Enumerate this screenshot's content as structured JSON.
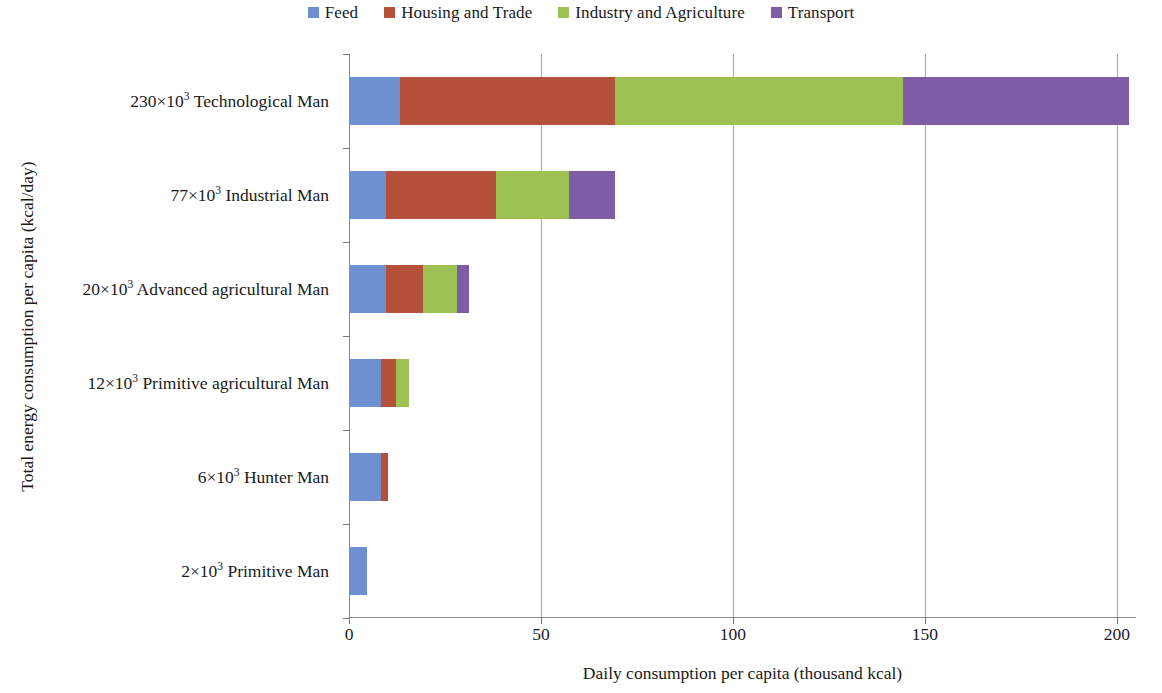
{
  "chart_data": {
    "type": "bar",
    "orientation": "horizontal",
    "stacked": true,
    "title": "",
    "xlabel": "Daily consumption per capita (thousand kcal)",
    "ylabel": "Total energy consumption per capita (kcal/day)",
    "xlim": [
      0,
      205
    ],
    "xticks": [
      0,
      50,
      100,
      150,
      200
    ],
    "xticklabels": [
      "0",
      "50",
      "100",
      "150",
      "200"
    ],
    "grid": "vertical",
    "legend_position": "top-center",
    "categories": [
      "230×10³ Technological Man",
      "77×10³ Industrial Man",
      "20×10³ Advanced agricultural Man",
      "12×10³ Primitive agricultural Man",
      "6×10³ Hunter Man",
      "2×10³ Primitive Man"
    ],
    "category_parts": [
      {
        "value": "230",
        "multiplier": "×10",
        "exponent": "3",
        "name": "Technological Man"
      },
      {
        "value": "77",
        "multiplier": "×10",
        "exponent": "3",
        "name": "Industrial Man"
      },
      {
        "value": "20",
        "multiplier": "×10",
        "exponent": "3",
        "name": "Advanced agricultural Man"
      },
      {
        "value": "12",
        "multiplier": "×10",
        "exponent": "3",
        "name": "Primitive agricultural Man"
      },
      {
        "value": "6",
        "multiplier": "×10",
        "exponent": "3",
        "name": "Hunter Man"
      },
      {
        "value": "2",
        "multiplier": "×10",
        "exponent": "3",
        "name": "Primitive Man"
      }
    ],
    "series": [
      {
        "name": "Feed",
        "color": "#6e8fd0",
        "values": [
          13,
          9.5,
          9.5,
          8,
          8,
          4.5
        ]
      },
      {
        "name": "Housing and Trade",
        "color": "#b5513b",
        "values": [
          56,
          28.5,
          9.5,
          4,
          2,
          0
        ]
      },
      {
        "name": "Industry and Agriculture",
        "color": "#9dc253",
        "values": [
          75,
          19,
          9,
          3.5,
          0,
          0
        ]
      },
      {
        "name": "Transport",
        "color": "#7f5ba8",
        "values": [
          59,
          12,
          3,
          0,
          0,
          0
        ]
      }
    ],
    "totals": [
      203,
      69,
      31,
      15.5,
      10,
      4.5
    ],
    "colors": {
      "feed": "#6e8fd0",
      "housing_and_trade": "#b5513b",
      "industry_and_agriculture": "#9dc253",
      "transport": "#7f5ba8",
      "axis": "#8a8a8a",
      "gridline": "#a8a8a8",
      "text": "#1a1a1a",
      "background": "#ffffff"
    }
  },
  "legend": {
    "items": [
      {
        "label": "Feed",
        "color": "#6e8fd0"
      },
      {
        "label": "Housing and Trade",
        "color": "#b5513b"
      },
      {
        "label": "Industry and Agriculture",
        "color": "#9dc253"
      },
      {
        "label": "Transport",
        "color": "#7f5ba8"
      }
    ]
  }
}
